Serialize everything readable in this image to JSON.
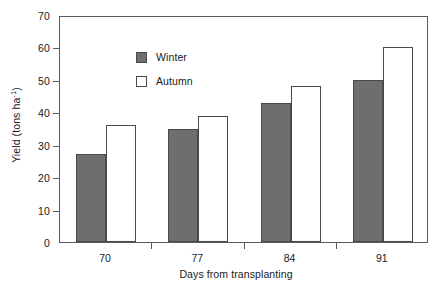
{
  "chart_data": {
    "type": "bar",
    "title": "",
    "subtitle": "",
    "xlabel": "Days from transplanting",
    "ylabel": "Yield (tons ha",
    "ylabel_sup": "-1",
    "ylabel_suffix": ")",
    "categories": [
      "70",
      "77",
      "84",
      "91"
    ],
    "series": [
      {
        "name": "Winter",
        "values": [
          27,
          35,
          43,
          50
        ],
        "color": "#6e6e6e",
        "filled": true
      },
      {
        "name": "Autumn",
        "values": [
          36,
          39,
          48,
          60
        ],
        "color": "#ffffff",
        "filled": false
      }
    ],
    "ylim": [
      0,
      70
    ],
    "ytick_values": [
      0,
      10,
      20,
      30,
      40,
      50,
      60,
      70
    ],
    "ytick_labels": [
      "0",
      "10",
      "20",
      "30",
      "40",
      "50",
      "60",
      "70"
    ],
    "grid": false,
    "legend_position": "top-left",
    "axis_color": "#5a5a5a",
    "bar_edge_color": "#4a4a4a"
  },
  "legend": {
    "entries": [
      {
        "label": "Winter"
      },
      {
        "label": "Autumn"
      }
    ]
  }
}
